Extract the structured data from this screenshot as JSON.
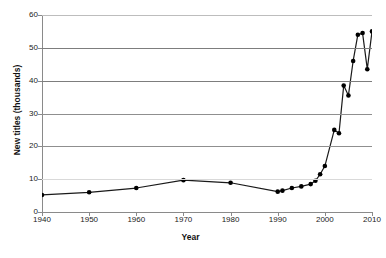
{
  "chart_data": {
    "type": "line",
    "title": "",
    "xlabel": "Year",
    "ylabel": "New titles (thousands)",
    "xlim": [
      1940,
      2010
    ],
    "ylim": [
      0,
      60
    ],
    "xticks": [
      1940,
      1950,
      1960,
      1970,
      1980,
      1990,
      2000,
      2010
    ],
    "xtick_labels": [
      "1940",
      "1950",
      "1960",
      "1970",
      "1980",
      "1990",
      "2000",
      "2010"
    ],
    "yticks": [
      0,
      10,
      20,
      30,
      40,
      50,
      60
    ],
    "ytick_labels": [
      "0",
      "10",
      "20",
      "30",
      "40",
      "50",
      "60"
    ],
    "grid": "horizontal",
    "legend": "none",
    "marker": "filled-circle",
    "line_color": "#1a1a1a",
    "marker_color": "#000000",
    "grid_color": "#9a9a9a",
    "axis_color": "#8a8a8a",
    "background": "#ffffff",
    "series": [
      {
        "name": "New titles",
        "x": [
          1940,
          1950,
          1960,
          1970,
          1980,
          1990,
          1991,
          1993,
          1995,
          1997,
          1998,
          1999,
          2000,
          2002,
          2003,
          2004,
          2005,
          2006,
          2007,
          2008,
          2009,
          2010
        ],
        "values": [
          5.2,
          6.0,
          7.3,
          9.7,
          8.9,
          6.2,
          6.5,
          7.3,
          7.8,
          8.5,
          9.5,
          11.5,
          14.0,
          25.0,
          24.0,
          38.5,
          35.5,
          46.0,
          54.0,
          54.5,
          43.5,
          55.0
        ]
      }
    ]
  }
}
